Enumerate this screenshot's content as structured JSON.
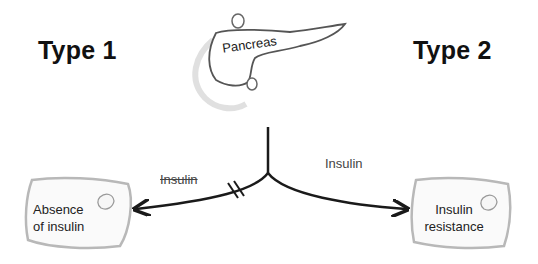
{
  "headings": {
    "left": "Type 1",
    "right": "Type 2"
  },
  "organ": {
    "label": "Pancreas",
    "icon": "pancreas-icon"
  },
  "branches": {
    "left": {
      "label": "Insulin",
      "label_style": "strikethrough",
      "blocked": true,
      "outcome_lines": [
        "Absence",
        "of insulin"
      ]
    },
    "right": {
      "label": "Insulin",
      "label_style": "normal",
      "blocked": false,
      "outcome_lines": [
        "Insulin",
        "resistance"
      ]
    }
  },
  "colors": {
    "stroke": "#1a1a1a",
    "box_border": "#b8b8b8",
    "box_fill": "#fafafa"
  }
}
